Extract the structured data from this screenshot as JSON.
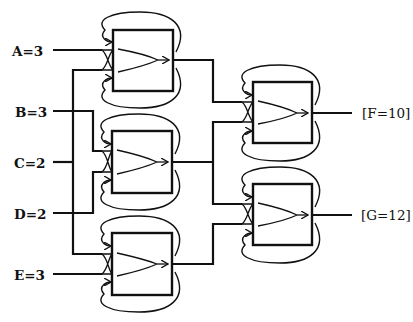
{
  "diagram": {
    "type": "circuit-network",
    "inputs": [
      {
        "id": "A",
        "label": "A=3",
        "y": 50
      },
      {
        "id": "B",
        "label": "B=3",
        "y": 111
      },
      {
        "id": "C",
        "label": "C=2",
        "y": 162
      },
      {
        "id": "D",
        "label": "D=2",
        "y": 213
      },
      {
        "id": "E",
        "label": "E=3",
        "y": 274
      }
    ],
    "outputs": [
      {
        "id": "F",
        "label": "[F=10]",
        "y": 113
      },
      {
        "id": "G",
        "label": "[G=12]",
        "y": 215
      }
    ],
    "nodes": [
      {
        "id": "box1",
        "x": 113,
        "y": 30,
        "w": 60,
        "h": 61,
        "inputs": [
          "A",
          "C"
        ]
      },
      {
        "id": "box2",
        "x": 112,
        "y": 131,
        "w": 60,
        "h": 62,
        "inputs": [
          "B",
          "D"
        ]
      },
      {
        "id": "box3",
        "x": 112,
        "y": 233,
        "w": 60,
        "h": 62,
        "inputs": [
          "C",
          "E"
        ]
      },
      {
        "id": "box4",
        "x": 253,
        "y": 82,
        "w": 59,
        "h": 61,
        "inputs": [
          "box1",
          "box2"
        ],
        "output": "F"
      },
      {
        "id": "box5",
        "x": 253,
        "y": 184,
        "w": 59,
        "h": 61,
        "inputs": [
          "box2",
          "box3"
        ],
        "output": "G"
      }
    ]
  }
}
